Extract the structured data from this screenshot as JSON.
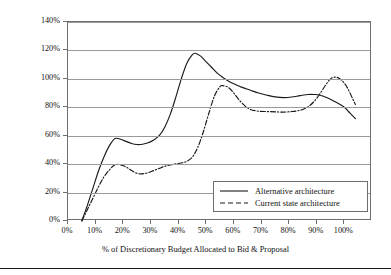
{
  "chart_data": {
    "type": "line",
    "title": "",
    "xlabel": "% of Discretionary Budget Allocated to Bid & Proposal",
    "ylabel": "Normalized Expected Profits",
    "xlim": [
      0,
      110
    ],
    "ylim": [
      0,
      140
    ],
    "grid": true,
    "legend_position": "lower-right-inside",
    "x_tick_labels": [
      "0%",
      "10%",
      "20%",
      "30%",
      "40%",
      "50%",
      "60%",
      "70%",
      "80%",
      "90%",
      "100%"
    ],
    "x_tick_values": [
      0,
      10,
      20,
      30,
      40,
      50,
      60,
      70,
      80,
      90,
      100
    ],
    "y_tick_labels": [
      "0%",
      "20%",
      "40%",
      "60%",
      "80%",
      "100%",
      "120%",
      "140%"
    ],
    "y_tick_values": [
      0,
      20,
      40,
      60,
      80,
      100,
      120,
      140
    ],
    "series": [
      {
        "name": "Alternative architecture",
        "style": "solid",
        "color": "#1a1a1a",
        "x": [
          5,
          7,
          9,
          11,
          13,
          15,
          17,
          19,
          21,
          23,
          25,
          27,
          29,
          31,
          33,
          35,
          37,
          39,
          41,
          43,
          45,
          46,
          48,
          50,
          52,
          54,
          56,
          58,
          60,
          63,
          66,
          69,
          72,
          75,
          78,
          81,
          84,
          87,
          89,
          91,
          94,
          97,
          100,
          102,
          104
        ],
        "y": [
          0,
          11,
          23,
          35,
          45,
          53,
          58,
          57.5,
          56,
          54.5,
          53.8,
          54,
          55,
          57,
          60,
          66,
          75,
          87,
          100,
          111,
          117,
          118,
          116,
          112,
          108,
          104,
          101,
          98.5,
          96.5,
          94,
          92,
          90,
          88.5,
          87.3,
          86.8,
          87.2,
          88.2,
          89,
          89,
          88.6,
          86.5,
          83.5,
          80,
          76,
          72
        ]
      },
      {
        "name": "Current state architecture",
        "style": "dashdot",
        "color": "#1a1a1a",
        "x": [
          5,
          7,
          9,
          11,
          13,
          15,
          17,
          19,
          21,
          23,
          25,
          27,
          29,
          31,
          33,
          35,
          37,
          39,
          41,
          43,
          45,
          47,
          49,
          51,
          53,
          55,
          56,
          58,
          60,
          62,
          64,
          66,
          69,
          72,
          75,
          78,
          81,
          83,
          85,
          87,
          89,
          91,
          93,
          95,
          97,
          99,
          101,
          103,
          104
        ],
        "y": [
          0,
          8,
          16,
          24,
          31,
          36,
          39.5,
          39.5,
          38,
          35.5,
          33.5,
          33.2,
          34,
          35.5,
          37,
          38.5,
          39.5,
          40.2,
          40.8,
          42,
          45,
          52,
          63,
          76,
          88,
          94.5,
          95.2,
          94,
          90,
          85,
          81,
          78.5,
          77.2,
          77,
          76.8,
          76.6,
          77,
          77.5,
          78.5,
          80.5,
          84,
          89,
          95,
          100,
          101.2,
          99,
          94,
          86,
          82
        ]
      }
    ]
  }
}
